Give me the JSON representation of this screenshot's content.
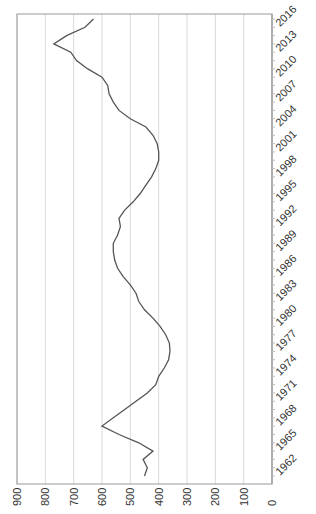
{
  "chart_data": {
    "type": "line",
    "title": "",
    "xlabel": "",
    "ylabel": "",
    "orientation_note": "figure rendered rotated 90 degrees clockwise",
    "x_tick_labels": [
      "1962",
      "1965",
      "1968",
      "1971",
      "1974",
      "1977",
      "1980",
      "1983",
      "1986",
      "1989",
      "1992",
      "1995",
      "1998",
      "2001",
      "2004",
      "2007",
      "2010",
      "2013",
      "2016"
    ],
    "y_tick_labels": [
      "0",
      "100",
      "200",
      "300",
      "400",
      "500",
      "600",
      "700",
      "800",
      "900"
    ],
    "ylim": [
      0,
      900
    ],
    "grid": true,
    "legend": null,
    "line_color": "#555555",
    "series": [
      {
        "name": "series",
        "x": [
          1962,
          1963,
          1964,
          1965,
          1966,
          1967,
          1968,
          1969,
          1970,
          1971,
          1972,
          1973,
          1974,
          1975,
          1976,
          1977,
          1978,
          1979,
          1980,
          1981,
          1982,
          1983,
          1984,
          1985,
          1986,
          1987,
          1988,
          1989,
          1990,
          1991,
          1992,
          1993,
          1994,
          1995,
          1996,
          1997,
          1998,
          1999,
          2000,
          2001,
          2002,
          2003,
          2004,
          2005,
          2006,
          2007,
          2008,
          2009,
          2010,
          2011,
          2012,
          2013,
          2014,
          2015,
          2016,
          2017
        ],
        "values": [
          450,
          440,
          455,
          420,
          470,
          540,
          600,
          560,
          520,
          480,
          440,
          410,
          400,
          380,
          365,
          360,
          362,
          375,
          395,
          420,
          450,
          470,
          480,
          500,
          525,
          545,
          555,
          560,
          560,
          545,
          535,
          540,
          520,
          490,
          465,
          445,
          425,
          410,
          400,
          400,
          405,
          420,
          445,
          500,
          540,
          560,
          575,
          580,
          600,
          650,
          690,
          710,
          770,
          725,
          660,
          630
        ]
      }
    ]
  }
}
